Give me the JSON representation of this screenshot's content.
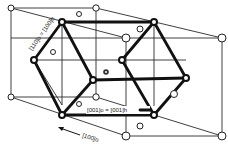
{
  "figure": {
    "type": "crystal-lattice-diagram",
    "labels": {
      "diag_left": "[110]o = [100]h",
      "center_right": "[001]o = [001]h",
      "bottom_arrow": "[100]o"
    }
  }
}
